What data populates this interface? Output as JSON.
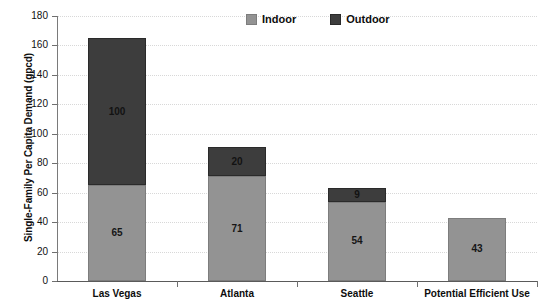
{
  "chart_data": {
    "type": "bar",
    "subtype": "stacked-bar",
    "title": "",
    "xlabel": "",
    "ylabel": "Single-Family Per Capita Demand (gpcd)",
    "ylim": [
      0,
      180
    ],
    "ytick_step": 20,
    "yticks": [
      0,
      20,
      40,
      60,
      80,
      100,
      120,
      140,
      160,
      180
    ],
    "ytick_labels": [
      "0",
      "20",
      "40",
      "60",
      "80",
      "100",
      "120",
      "140",
      "160",
      "180"
    ],
    "grid": true,
    "grid_axis": "y",
    "grid_style": "dotted",
    "legend_position": "top-center",
    "categories": [
      "Las Vegas",
      "Atlanta",
      "Seattle",
      "Potential Efficient Use"
    ],
    "series": [
      {
        "name": "Indoor",
        "color": "#939393",
        "values": [
          65,
          71,
          54,
          43
        ],
        "labels": [
          "65",
          "71",
          "54",
          "43"
        ]
      },
      {
        "name": "Outdoor",
        "color": "#3d3d3d",
        "values": [
          100,
          20,
          9,
          0
        ],
        "labels": [
          "100",
          "20",
          "9",
          ""
        ]
      }
    ],
    "totals": [
      165,
      91,
      63,
      43
    ]
  },
  "legend": {
    "items": [
      {
        "label": "Indoor",
        "swatch": "indoor"
      },
      {
        "label": "Outdoor",
        "swatch": "outdoor"
      }
    ]
  }
}
